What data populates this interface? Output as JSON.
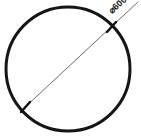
{
  "drawing": {
    "title": "Circle diameter dimension drawing",
    "background_color": "#ffffff",
    "width": 141,
    "height": 138,
    "circle": {
      "name": "circle-outline",
      "center_x": 68,
      "center_y": 69,
      "radius": 62,
      "stroke_color": "#151515",
      "stroke_width": 3,
      "fill": "none"
    },
    "dimension": {
      "label": "⌀600",
      "symbol": "⌀",
      "value": "600",
      "rotation_deg": -42,
      "line": {
        "name": "diameter-dimension-line",
        "x1": 22,
        "y1": 110,
        "x2": 138,
        "y2": 2,
        "stroke_color": "#6e6e6e",
        "stroke_width": 1
      },
      "ticks": [
        {
          "name": "tick-lower-left",
          "x": 25,
          "y": 107,
          "angle_deg": -42
        },
        {
          "name": "tick-upper-right",
          "x": 111,
          "y": 27,
          "angle_deg": -42
        }
      ],
      "text_anchor": {
        "x": 112,
        "y": 14
      }
    }
  }
}
